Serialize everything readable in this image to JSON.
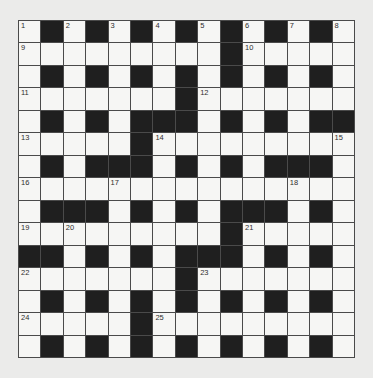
{
  "puzzle": {
    "type": "crossword",
    "size": {
      "rows": 15,
      "cols": 15
    },
    "colors": {
      "background": "#ebebea",
      "white_cell": "#f6f6f4",
      "black_cell": "#1f1f1f",
      "grid_line": "#4a4a4a",
      "number": "#2e2e2e"
    },
    "grid": [
      "W B W B W B W B W B W B W B W",
      "W W W W W W W W W B W W W W W",
      "W B W B W B W B W B W B W B W",
      "W W W W W W W B W W W W W W W",
      "W B W B W B B B W B W B W B B",
      "W W W W W B W W W W W W W W W",
      "W B W B B B W B W B W B B B W",
      "W W W W W W W W W W W W W W W",
      "W B B B W B W B W B B B W B W",
      "W W W W W W W W W B W W W W W",
      "B B W B W B W B B B W B W B W",
      "W W W W W W W B W W W W W W W",
      "W B W B W B W B W B W B W B W",
      "W W W W W B W W W W W W W W W",
      "W B W B W B W B W B W B W B W"
    ],
    "numbers": [
      {
        "n": "1",
        "r": 0,
        "c": 0
      },
      {
        "n": "2",
        "r": 0,
        "c": 2
      },
      {
        "n": "3",
        "r": 0,
        "c": 4
      },
      {
        "n": "4",
        "r": 0,
        "c": 6
      },
      {
        "n": "5",
        "r": 0,
        "c": 8
      },
      {
        "n": "6",
        "r": 0,
        "c": 10
      },
      {
        "n": "7",
        "r": 0,
        "c": 12
      },
      {
        "n": "8",
        "r": 0,
        "c": 14
      },
      {
        "n": "9",
        "r": 1,
        "c": 0
      },
      {
        "n": "10",
        "r": 1,
        "c": 10
      },
      {
        "n": "11",
        "r": 3,
        "c": 0
      },
      {
        "n": "12",
        "r": 3,
        "c": 8
      },
      {
        "n": "13",
        "r": 5,
        "c": 0
      },
      {
        "n": "14",
        "r": 5,
        "c": 6
      },
      {
        "n": "15",
        "r": 5,
        "c": 14
      },
      {
        "n": "16",
        "r": 7,
        "c": 0
      },
      {
        "n": "17",
        "r": 7,
        "c": 4
      },
      {
        "n": "18",
        "r": 7,
        "c": 12
      },
      {
        "n": "19",
        "r": 9,
        "c": 0
      },
      {
        "n": "20",
        "r": 9,
        "c": 2
      },
      {
        "n": "21",
        "r": 9,
        "c": 10
      },
      {
        "n": "22",
        "r": 11,
        "c": 0
      },
      {
        "n": "23",
        "r": 11,
        "c": 8
      },
      {
        "n": "24",
        "r": 13,
        "c": 0
      },
      {
        "n": "25",
        "r": 13,
        "c": 6
      }
    ]
  }
}
